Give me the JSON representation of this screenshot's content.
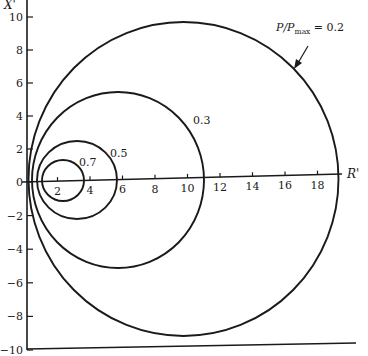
{
  "chart_data": {
    "type": "line",
    "title": "",
    "xlabel": "R'",
    "ylabel": "X'",
    "xlim": [
      0,
      20
    ],
    "ylim": [
      -10,
      10
    ],
    "grid": false,
    "x_ticks": [
      2,
      4,
      6,
      8,
      10,
      12,
      14,
      16,
      18
    ],
    "y_ticks": [
      10,
      8,
      6,
      4,
      2,
      0,
      -2,
      -4,
      -6,
      -8,
      -10
    ],
    "legend_title": "P/Pmax",
    "series": [
      {
        "name": "P/Pmax = 0.2",
        "label": "P/Pmax = 0.2",
        "shape": "circle",
        "center": [
          9.7,
          0.2
        ],
        "radius": 9.6
      },
      {
        "name": "0.3",
        "label": "0.3",
        "shape": "circle",
        "center": [
          5.6,
          0.0
        ],
        "radius": 5.4
      },
      {
        "name": "0.5",
        "label": "0.5",
        "shape": "circle",
        "center": [
          3.1,
          0.0
        ],
        "radius": 2.45
      },
      {
        "name": "0.7",
        "label": "0.7",
        "shape": "circle",
        "center": [
          2.2,
          0.0
        ],
        "radius": 1.3
      }
    ],
    "annotations": [
      {
        "text": "P/Pmax = 0.2",
        "arrow_to": [
          12.9,
          9.0
        ]
      }
    ]
  },
  "axes": {
    "x_label": "R'",
    "y_label": "X'",
    "x_tick_labels": [
      "2",
      "4",
      "6",
      "8",
      "10",
      "12",
      "14",
      "16",
      "18"
    ],
    "y_tick_labels": [
      "10",
      "8",
      "6",
      "4",
      "2",
      "0",
      "−2",
      "−4",
      "−6",
      "−8",
      "−10"
    ]
  },
  "labels": {
    "p02_prefix": "P/P",
    "p02_sub": "max",
    "p02_suffix": " = 0.2",
    "p03": "0.3",
    "p05": "0.5",
    "p07": "0.7"
  }
}
